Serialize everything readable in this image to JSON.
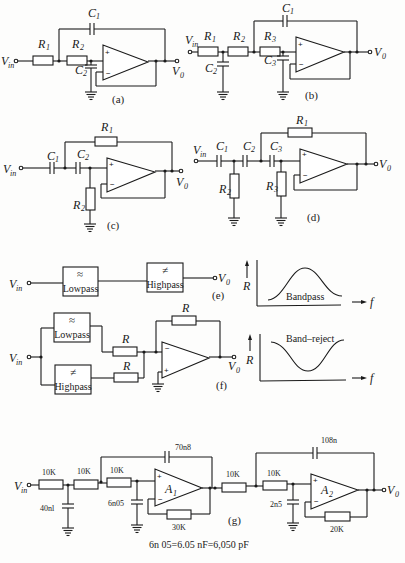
{
  "figure": {
    "panels": {
      "a": {
        "tag": "(a)",
        "labels": {
          "vin": "V",
          "vin_sub": "in",
          "vout": "V",
          "vout_sub": "0",
          "r1": "R",
          "r1_sub": "1",
          "r2": "R",
          "r2_sub": "2",
          "c1": "C",
          "c1_sub": "1",
          "c2": "C",
          "c2_sub": "2"
        }
      },
      "b": {
        "tag": "(b)",
        "labels": {
          "vin": "V",
          "vin_sub": "in",
          "vout": "V",
          "vout_sub": "0",
          "r1": "R",
          "r1_sub": "1",
          "r2": "R",
          "r2_sub": "2",
          "r3": "R",
          "r3_sub": "3",
          "c1": "C",
          "c1_sub": "1",
          "c2": "C",
          "c2_sub": "2",
          "c3": "C",
          "c3_sub": "3"
        }
      },
      "c": {
        "tag": "(c)",
        "labels": {
          "vin": "V",
          "vin_sub": "in",
          "vout": "V",
          "vout_sub": "0",
          "r1": "R",
          "r1_sub": "1",
          "r2": "R",
          "r2_sub": "2",
          "c1": "C",
          "c1_sub": "1",
          "c2": "C",
          "c2_sub": "2"
        }
      },
      "d": {
        "tag": "(d)",
        "labels": {
          "vin": "V",
          "vin_sub": "in",
          "vout": "V",
          "vout_sub": "0",
          "r1": "R",
          "r1_sub": "1",
          "r2": "R",
          "r2_sub": "2",
          "r3": "R",
          "r3_sub": "3",
          "c1": "C",
          "c1_sub": "1",
          "c2": "C",
          "c2_sub": "2",
          "c3": "C",
          "c3_sub": "3"
        }
      },
      "e": {
        "tag": "(e)",
        "labels": {
          "vin": "V",
          "vin_sub": "in",
          "vout": "V",
          "vout_sub": "0",
          "lowpass": "Lowpass",
          "highpass": "Highpass",
          "lowpass_symbol": "≈",
          "highpass_symbol": "≠"
        }
      },
      "f": {
        "tag": "(f)",
        "labels": {
          "vin": "V",
          "vin_sub": "in",
          "vout": "V",
          "vout_sub": "0",
          "lowpass": "Lowpass",
          "highpass": "Highpass",
          "lowpass_symbol": "≈",
          "highpass_symbol": "≠",
          "r_top": "R",
          "r_mid": "R",
          "r_bot": "R"
        }
      },
      "g": {
        "tag": "(g)",
        "labels": {
          "vin": "V",
          "vin_sub": "in",
          "vout": "V",
          "vout_sub": "0",
          "r1": "10K",
          "r2": "10K",
          "r3": "10K",
          "r4": "10K",
          "r5": "10K",
          "c_in": "40nl",
          "c_a1_plus": "6n05",
          "c_a1_fb": "70n8",
          "r_a1_fb": "30K",
          "c_a2_plus": "2n5",
          "c_a2_fb": "108n",
          "r_a2_fb": "20K",
          "a1": "A",
          "a1_sub": "1",
          "a2": "A",
          "a2_sub": "2"
        },
        "note": "6n 05=6.05  nF=6,050 pF"
      }
    },
    "plots": {
      "bandpass": {
        "label": "Bandpass",
        "yaxis": "R",
        "xaxis": "f"
      },
      "bandreject": {
        "label": "Band–reject",
        "yaxis": "R",
        "xaxis": "f"
      }
    }
  }
}
